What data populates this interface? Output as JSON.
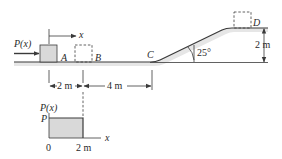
{
  "diagram": {
    "force_label": "P(x)",
    "displacement_label": "x",
    "point_labels": {
      "a": "A",
      "b": "B",
      "c": "C",
      "d": "D"
    },
    "angle_label": "25°",
    "height_label": "2 m",
    "dimensions": {
      "ab": "2 m",
      "bc": "4 m"
    },
    "colors": {
      "block_fill": "#d9d9d9",
      "ground_fill": "#e6e6e6",
      "line": "#3a3a3a"
    }
  },
  "graph": {
    "ylabel": "P(x)",
    "y_tick": "P",
    "xlabel": "x",
    "x_ticks": [
      "0",
      "2 m"
    ]
  }
}
